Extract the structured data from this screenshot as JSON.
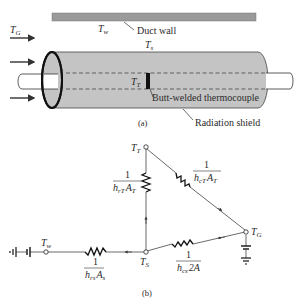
{
  "figure_a": {
    "caption": "(a)",
    "labels": {
      "gas_temp": "T",
      "gas_temp_sub": "G",
      "wall_temp": "T",
      "wall_temp_sub": "w",
      "shield_temp": "T",
      "shield_temp_sub": "s",
      "thermo_temp": "T",
      "thermo_temp_sub": "T"
    },
    "callouts": {
      "duct_wall": "Duct wall",
      "thermocouple": "Butt-welded thermocouple",
      "radiation_shield": "Radiation shield"
    },
    "colors": {
      "duct_wall": "#9a9a9a",
      "shield_fill": "#c4c4c4",
      "outline": "#333333"
    }
  },
  "figure_b": {
    "caption": "(b)",
    "nodes": {
      "TT": {
        "main": "T",
        "sub": "T"
      },
      "TG": {
        "main": "T",
        "sub": "G"
      },
      "TS": {
        "main": "T",
        "sub": "S"
      },
      "Tw": {
        "main": "T",
        "sub": "w"
      }
    },
    "resistances": {
      "rT": {
        "num": "1",
        "den_h": "h",
        "den_hsub": "rT",
        "den_a": "A",
        "den_asub": "T"
      },
      "cT": {
        "num": "1",
        "den_h": "h",
        "den_hsub": "cT",
        "den_a": "A",
        "den_asub": "T"
      },
      "cs": {
        "num": "1",
        "den_h": "h",
        "den_hsub": "cs",
        "den_a": "2A",
        "den_asub": ""
      },
      "rs": {
        "num": "1",
        "den_h": "h",
        "den_hsub": "rs",
        "den_a": "A",
        "den_asub": "s"
      }
    }
  }
}
